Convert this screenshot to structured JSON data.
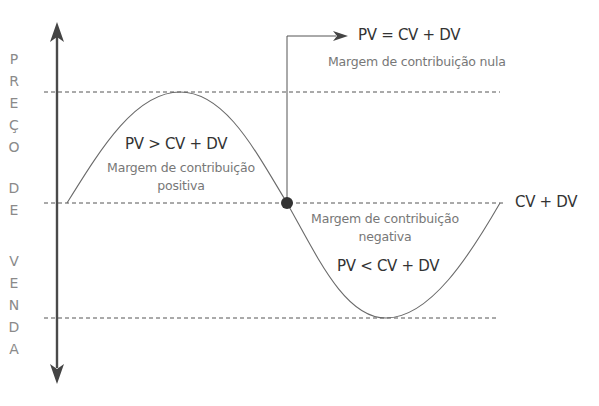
{
  "axis": {
    "letters": [
      "P",
      "R",
      "E",
      "Ç",
      "O",
      "D",
      "E",
      "V",
      "E",
      "N",
      "D",
      "A"
    ],
    "title": "PREÇO DE VENDA"
  },
  "labels": {
    "breakeven_formula": "PV = CV + DV",
    "breakeven_desc": "Margem de contribuição nula",
    "positive_formula": "PV > CV + DV",
    "positive_desc_line1": "Margem de contribuição",
    "positive_desc_line2": "positiva",
    "negative_desc_line1": "Margem de contribuição",
    "negative_desc_line2": "negativa",
    "negative_formula": "PV < CV + DV",
    "reference_line": "CV + DV"
  },
  "colors": {
    "axis": "#4a4a4a",
    "curve": "#6a6a6a",
    "dashed": "#555555",
    "dot": "#333333"
  }
}
